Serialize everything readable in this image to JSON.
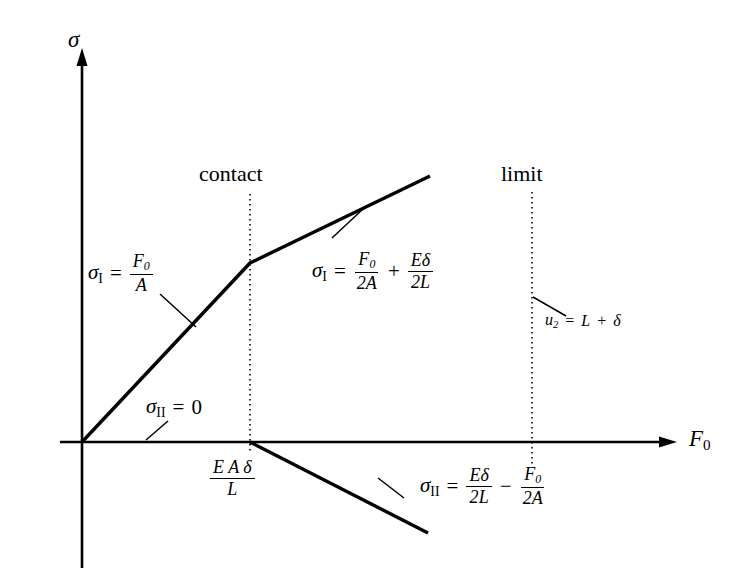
{
  "figure": {
    "type": "diagram",
    "axes": {
      "y_label": "σ",
      "x_label": "F₀",
      "origin_label": ""
    },
    "markers": [
      {
        "name": "contact",
        "label": "contact"
      },
      {
        "name": "limit",
        "label": "limit"
      }
    ],
    "tick": {
      "x_contact": {
        "num": "E A δ",
        "den": "L"
      }
    },
    "annotations": {
      "sigma_I_lower": {
        "lhs_sym": "σ",
        "lhs_sub": "I",
        "eq": "=",
        "frac_num": "F₀",
        "frac_den": "A"
      },
      "sigma_I_upper": {
        "lhs_sym": "σ",
        "lhs_sub": "I",
        "eq": "=",
        "term1_num": "F₀",
        "term1_den": "2A",
        "op": "+",
        "term2_num": "Eδ",
        "term2_den": "2L"
      },
      "sigma_II_zero": {
        "lhs_sym": "σ",
        "lhs_sub": "II",
        "eq": "=",
        "value": "0"
      },
      "sigma_II_expr": {
        "lhs_sym": "σ",
        "lhs_sub": "II",
        "eq": "=",
        "term1_num": "Eδ",
        "term1_den": "2L",
        "op": "−",
        "term2_num": "F₀",
        "term2_den": "2A"
      },
      "u2_limit": {
        "lhs_sym": "u",
        "lhs_sub": "2",
        "eq": "=",
        "rhs1": "L",
        "op": "+",
        "rhs2": "δ"
      }
    },
    "colors": {
      "stroke": "#000000",
      "background": "#ffffff"
    },
    "geometry": {
      "origin": [
        82,
        442
      ],
      "contact_x": 250,
      "limit_x": 532,
      "curve_I_lower": [
        [
          82,
          442
        ],
        [
          250,
          263
        ]
      ],
      "curve_I_upper": [
        [
          250,
          263
        ],
        [
          430,
          176
        ]
      ],
      "curve_II_zero": [
        [
          82,
          442
        ],
        [
          675,
          442
        ]
      ],
      "curve_II_neg": [
        [
          250,
          442
        ],
        [
          428,
          533
        ]
      ]
    }
  }
}
